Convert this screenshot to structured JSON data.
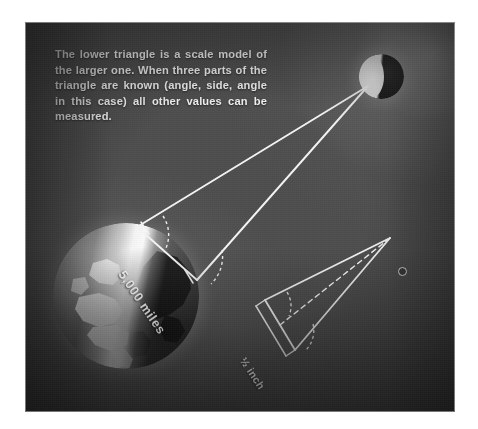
{
  "figure": {
    "domain_type": "diagram-photograph",
    "caption": "The lower triangle is a scale model of the larger one. When three parts of the triangle are known (angle, side, angle in this case) all other values can be measured.",
    "background_color": "#4e4e4e",
    "line_color": "#f2f2f2",
    "text_color": "#f2f2f2"
  },
  "labels": {
    "baseline_distance": "5,000 miles",
    "model_baseline": "½ inch"
  },
  "objects": {
    "earth": {
      "name": "Earth",
      "description": "Illuminated globe showing North America and the polar region"
    },
    "moon": {
      "name": "Moon",
      "description": "Half-lit sphere at upper right"
    },
    "model_moon": {
      "name": "Model moon",
      "description": "Small circle marking the scale-model moon position"
    }
  },
  "diagram": {
    "large_triangle": {
      "name": "Earth-Moon triangle",
      "vertex_apex": "Moon",
      "vertex_base_upper": "Earth observation point A",
      "vertex_base_lower": "Earth observation point B",
      "baseline_label": "5,000 miles",
      "angles_marked": 2
    },
    "small_triangle": {
      "name": "Scale model triangle",
      "vertex_apex": "Model moon",
      "baseline_label": "½ inch",
      "angles_marked": 2,
      "has_median_dashed_line": true
    }
  }
}
